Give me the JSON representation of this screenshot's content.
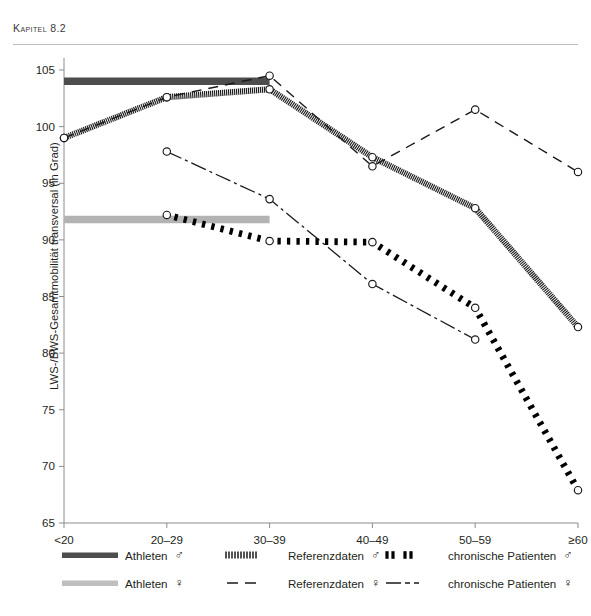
{
  "running_head": {
    "prefix": "Kapitel",
    "number": "8.2",
    "full": "Kapitel 8.2"
  },
  "chart_data": {
    "type": "line",
    "title": "",
    "xlabel": "",
    "ylabel": "LWS-/BWS-Gesamtmobilität transversal (in Grad)",
    "categories": [
      "<20",
      "20–29",
      "30–39",
      "40–49",
      "50–59",
      "≥60"
    ],
    "ylim": [
      65,
      105
    ],
    "yticks": [
      65,
      70,
      75,
      80,
      85,
      90,
      95,
      100,
      105
    ],
    "ytick_labels": [
      "65",
      "70",
      "75",
      "80",
      "85",
      "90",
      "95",
      "100",
      "105"
    ],
    "grid": false,
    "legend_position": "bottom",
    "series": [
      {
        "name": "Athleten ♂",
        "style": "thick-bar",
        "color": "#4d4d4d",
        "markers": false,
        "x": [
          "<20",
          "30–39"
        ],
        "values": [
          104.0,
          104.0
        ]
      },
      {
        "name": "Athleten ♀",
        "style": "thick-bar",
        "color": "#b3b3b3",
        "markers": false,
        "x": [
          "<20",
          "30–39"
        ],
        "values": [
          91.8,
          91.8
        ]
      },
      {
        "name": "Referenzdaten ♂",
        "style": "hatched",
        "color": "#1a1a1a",
        "markers": true,
        "x": [
          "<20",
          "20–29",
          "30–39",
          "40–49",
          "50–59",
          "≥60"
        ],
        "values": [
          99.0,
          102.6,
          103.3,
          97.3,
          92.8,
          82.3
        ]
      },
      {
        "name": "Referenzdaten ♀",
        "style": "dashed",
        "color": "#1a1a1a",
        "markers": true,
        "x": [
          "<20",
          "20–29",
          "30–39",
          "40–49",
          "50–59",
          "≥60"
        ],
        "values": [
          99.0,
          102.6,
          104.5,
          96.5,
          101.5,
          96.0
        ]
      },
      {
        "name": "chronische Patienten ♂",
        "style": "thick-dotted",
        "color": "#000000",
        "markers": true,
        "x": [
          "20–29",
          "30–39",
          "40–49",
          "50–59",
          "≥60"
        ],
        "values": [
          92.2,
          89.9,
          89.8,
          84.0,
          67.9
        ]
      },
      {
        "name": "chronische Patienten ♀",
        "style": "dash-dot",
        "color": "#1a1a1a",
        "markers": true,
        "x": [
          "20–29",
          "30–39",
          "40–49",
          "50–59"
        ],
        "values": [
          97.8,
          93.6,
          86.1,
          81.2
        ]
      }
    ]
  },
  "legend": {
    "items": [
      {
        "label": "Athleten",
        "sex": "♂",
        "style": "thick-bar-dark"
      },
      {
        "label": "Referenzdaten",
        "sex": "♂",
        "style": "hatched"
      },
      {
        "label": "chronische Patienten",
        "sex": "♂",
        "style": "thick-dotted"
      },
      {
        "label": "Athleten",
        "sex": "♀",
        "style": "thick-bar-light"
      },
      {
        "label": "Referenzdaten",
        "sex": "♀",
        "style": "dashed"
      },
      {
        "label": "chronische Patienten",
        "sex": "♀",
        "style": "dash-dot"
      }
    ]
  }
}
